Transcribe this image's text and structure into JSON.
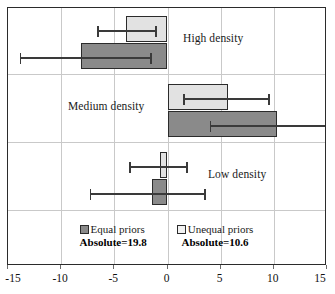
{
  "chart_data": {
    "type": "bar",
    "orientation": "horizontal",
    "title": "",
    "xlabel": "",
    "ylabel": "",
    "xlim": [
      -15,
      15
    ],
    "xticks": [
      -15,
      -10,
      -5,
      0,
      5,
      10,
      15
    ],
    "xticklabels": [
      "-15",
      "-10",
      "-5",
      "0",
      "5",
      "10",
      "15"
    ],
    "grid": true,
    "grid_axis": "both",
    "legend_position": "bottom-center",
    "categories": [
      "High density",
      "Medium density",
      "Low density"
    ],
    "series": [
      {
        "name": "Equal priors",
        "absolute_label": "Absolute=19.8",
        "absolute_value": 19.8,
        "color": "#8a8a8a",
        "values": [
          -8.1,
          10.3,
          -1.5
        ],
        "err_low": [
          -13.9,
          4.0,
          -7.3
        ],
        "err_high": [
          -1.5,
          15.0,
          3.6
        ]
      },
      {
        "name": "Unequal priors",
        "absolute_label": "Absolute=10.6",
        "absolute_value": 10.6,
        "color": "#e2e2e2",
        "values": [
          -3.9,
          5.7,
          -0.7
        ],
        "err_low": [
          -6.6,
          1.5,
          -3.6
        ],
        "err_high": [
          -1.0,
          9.6,
          1.9
        ]
      }
    ]
  },
  "legend": {
    "entries": [
      {
        "name": "Equal priors",
        "absolute": "Absolute=19.8",
        "swatch": "equal"
      },
      {
        "name": "Unequal priors",
        "absolute": "Absolute=10.6",
        "swatch": "unequal"
      }
    ]
  },
  "axis": {
    "ticks": [
      {
        "value": -15,
        "label": "-15"
      },
      {
        "value": -10,
        "label": "-10"
      },
      {
        "value": -5,
        "label": "-5"
      },
      {
        "value": 0,
        "label": "0"
      },
      {
        "value": 5,
        "label": "5"
      },
      {
        "value": 10,
        "label": "10"
      },
      {
        "value": 15,
        "label": "15"
      }
    ]
  },
  "groups": [
    {
      "label": "High density"
    },
    {
      "label": "Medium density"
    },
    {
      "label": "Low density"
    }
  ]
}
